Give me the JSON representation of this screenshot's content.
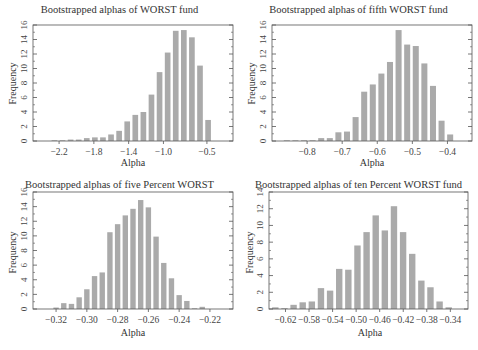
{
  "figure": {
    "panels": [
      {
        "id": "p1",
        "title": "Bootstrapped alphas of WORST fund",
        "xlabel": "Alpha",
        "ylabel": "Frequency"
      },
      {
        "id": "p2",
        "title": "Bootstrapped alphas of fifth WORST fund",
        "xlabel": "Alpha",
        "ylabel": "Frequency"
      },
      {
        "id": "p3",
        "title": "Bootstrapped alphas of five Percent WORST",
        "xlabel": "Alpha",
        "ylabel": "Frequency"
      },
      {
        "id": "p4",
        "title": "Bootstrapped alphas of ten Percent WORST fund",
        "xlabel": "Alpha",
        "ylabel": "Frequency"
      }
    ],
    "bar_color": "#aaaaaa",
    "axis_color": "#555555"
  },
  "chart_data": [
    {
      "type": "bar",
      "title": "Bootstrapped alphas of WORST fund",
      "xlabel": "Alpha",
      "ylabel": "Frequency",
      "xlim": [
        -2.5,
        -0.2
      ],
      "ylim": [
        0,
        16
      ],
      "xticks": [
        -2.2,
        -1.8,
        -1.4,
        -1.0,
        -0.5
      ],
      "xtick_labels": [
        "−2.2",
        "−1.8",
        "−1.4",
        "−1.0",
        "−0.5"
      ],
      "yticks": [
        0,
        2,
        4,
        6,
        8,
        10,
        12,
        14,
        16
      ],
      "bin_start": -2.3,
      "bin_width": 0.093,
      "values": [
        0.1,
        0.1,
        0.2,
        0.2,
        0.4,
        0.5,
        0.5,
        0.9,
        1.4,
        2.7,
        3.6,
        4.0,
        6.4,
        9.5,
        12.2,
        15.2,
        15.3,
        14.3,
        10.4,
        2.9
      ]
    },
    {
      "type": "bar",
      "title": "Bootstrapped alphas of fifth WORST fund",
      "xlabel": "Alpha",
      "ylabel": "Frequency",
      "xlim": [
        -0.9,
        -0.33
      ],
      "ylim": [
        0,
        16
      ],
      "xticks": [
        -0.8,
        -0.7,
        -0.6,
        -0.5,
        -0.4
      ],
      "xtick_labels": [
        "−0.8",
        "−0.7",
        "−0.6",
        "−0.5",
        "−0.4"
      ],
      "yticks": [
        0,
        2,
        4,
        6,
        8,
        10,
        12,
        14,
        16
      ],
      "bin_start": -0.87,
      "bin_width": 0.0245,
      "values": [
        0.1,
        0.1,
        0.1,
        0.1,
        0.4,
        0.4,
        1.2,
        1.3,
        3.3,
        6.8,
        7.8,
        9.3,
        10.9,
        15.3,
        13.3,
        13.1,
        10.7,
        7.6,
        2.8,
        0.9
      ]
    },
    {
      "type": "bar",
      "title": "Bootstrapped alphas of five Percent WORST",
      "xlabel": "Alpha",
      "ylabel": "Frequency",
      "xlim": [
        -0.335,
        -0.205
      ],
      "ylim": [
        0,
        16
      ],
      "xticks": [
        -0.32,
        -0.3,
        -0.28,
        -0.26,
        -0.24,
        -0.22
      ],
      "xtick_labels": [
        "−0.32",
        "−0.30",
        "−0.28",
        "−0.26",
        "−0.24",
        "−0.22"
      ],
      "yticks": [
        0,
        2,
        4,
        6,
        8,
        10,
        12,
        14,
        16
      ],
      "bin_start": -0.3225,
      "bin_width": 0.005,
      "values": [
        0.2,
        0.8,
        0.7,
        1.6,
        2.7,
        4.5,
        5.0,
        10.5,
        11.6,
        12.8,
        13.7,
        14.9,
        13.9,
        9.9,
        6.3,
        4.2,
        1.9,
        1.1,
        0.1,
        0.3
      ]
    },
    {
      "type": "bar",
      "title": "Bootstrapped alphas of ten Percent WORST fund",
      "xlabel": "Alpha",
      "ylabel": "Frequency",
      "xlim": [
        -0.648,
        -0.31
      ],
      "ylim": [
        0,
        14
      ],
      "xticks": [
        -0.62,
        -0.58,
        -0.54,
        -0.5,
        -0.46,
        -0.42,
        -0.38,
        -0.34
      ],
      "xtick_labels": [
        "−0.62",
        "−0.58",
        "−0.54",
        "−0.50",
        "−0.46",
        "−0.42",
        "−0.38",
        "−0.34"
      ],
      "yticks": [
        0,
        2,
        4,
        6,
        8,
        10,
        12,
        14
      ],
      "bin_start": -0.645,
      "bin_width": 0.0155,
      "values": [
        0.2,
        0.1,
        0.5,
        0.8,
        0.9,
        2.5,
        2.2,
        4.8,
        4.7,
        7.6,
        9.2,
        11.2,
        9.4,
        12.3,
        9.2,
        6.6,
        3.4,
        2.6,
        0.9,
        0.2
      ]
    }
  ]
}
